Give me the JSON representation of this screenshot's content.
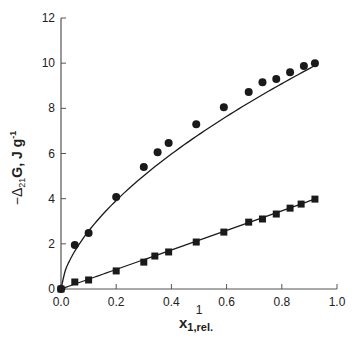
{
  "chart_data": {
    "type": "scatter",
    "title": "",
    "xlabel": "x1,rel.",
    "xlabel_main": "x",
    "xlabel_sub": "1,rel.",
    "xlabel_stray": "1",
    "ylabel": "−Δ21G, J g-1",
    "ylabel_parts": {
      "prefix": "−Δ",
      "sub": "21",
      "mid": "G, J g",
      "sup": "-1"
    },
    "xlim": [
      0.0,
      1.0
    ],
    "ylim": [
      0,
      12
    ],
    "xticks": [
      "0.0",
      "0.2",
      "0.4",
      "0.6",
      "0.8",
      "1.0"
    ],
    "yticks": [
      "0",
      "2",
      "4",
      "6",
      "8",
      "10",
      "12"
    ],
    "grid": false,
    "legend": "none",
    "series": [
      {
        "name": "circles",
        "marker": "circle",
        "line": "smooth fit curve",
        "x": [
          0.0,
          0.05,
          0.1,
          0.2,
          0.3,
          0.35,
          0.39,
          0.49,
          0.59,
          0.68,
          0.73,
          0.78,
          0.83,
          0.88,
          0.92
        ],
        "y": [
          0.0,
          1.95,
          2.48,
          4.07,
          5.4,
          6.06,
          6.46,
          7.3,
          8.05,
          8.72,
          9.16,
          9.3,
          9.6,
          9.87,
          10.0
        ]
      },
      {
        "name": "squares",
        "marker": "square",
        "line": "smooth fit curve",
        "x": [
          0.0,
          0.05,
          0.1,
          0.2,
          0.3,
          0.34,
          0.39,
          0.49,
          0.59,
          0.68,
          0.73,
          0.78,
          0.83,
          0.87,
          0.92
        ],
        "y": [
          0.0,
          0.31,
          0.4,
          0.8,
          1.19,
          1.46,
          1.64,
          2.08,
          2.52,
          2.96,
          3.1,
          3.32,
          3.58,
          3.76,
          3.98
        ]
      }
    ],
    "colors": {
      "marker": "#1a1a1a",
      "line": "#1a1a1a",
      "axis": "#555555"
    }
  }
}
